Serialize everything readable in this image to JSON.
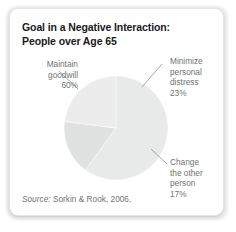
{
  "card": {
    "title": "Goal in a Negative Interaction:\nPeople over Age 65",
    "source_label": "Source:",
    "source_text": " Sorkin & Rook, 2006."
  },
  "labels": {
    "maintain_goodwill": "Maintain\ngoodwill\n60%",
    "minimize_distress": "Minimize\npersonal\ndistress\n23%",
    "change_other_person": "Change\nthe other\nperson\n17%"
  },
  "chart_data": {
    "type": "pie",
    "title": "Goal in a Negative Interaction: People over Age 65",
    "subtitle": "",
    "xlabel": "",
    "ylabel": "",
    "source": "Source: Sorkin & Rook, 2006.",
    "legend_position": "callout-labels",
    "grid": false,
    "units": "percent",
    "total": 100,
    "categories": [
      "Maintain goodwill",
      "Minimize personal distress",
      "Change the other person"
    ],
    "values": [
      60,
      23,
      17
    ],
    "labels_formatted": [
      "60%",
      "23%",
      "17%"
    ],
    "colors": [
      "#e8e9e9",
      "#ececec",
      "#e0e1e1"
    ],
    "slices": [
      {
        "name": "Maintain goodwill",
        "value": 60,
        "label": "60%",
        "color": "#e8e9e9",
        "start_angle_deg": 0,
        "end_angle_deg": 216
      },
      {
        "name": "Minimize personal distress",
        "value": 23,
        "label": "23%",
        "color": "#ececec",
        "start_angle_deg": 277.2,
        "end_angle_deg": 360
      },
      {
        "name": "Change the other person",
        "value": 17,
        "label": "17%",
        "color": "#e0e1e1",
        "start_angle_deg": 216,
        "end_angle_deg": 277.2
      }
    ]
  }
}
